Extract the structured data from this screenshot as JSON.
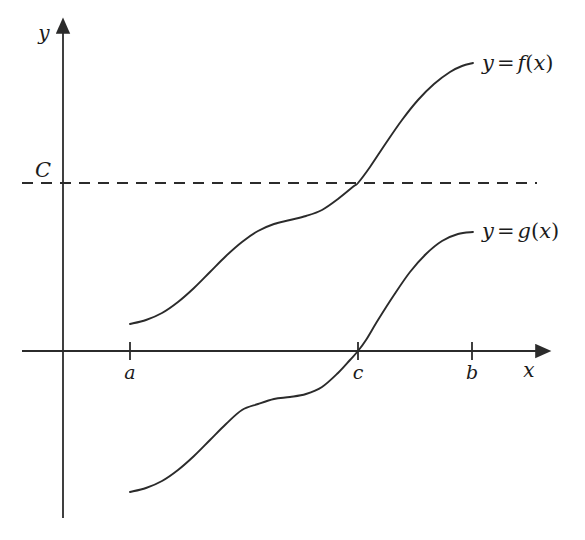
{
  "figure": {
    "kind": "math-diagram",
    "background_color": "#ffffff",
    "ink_color": "#2b2b2b",
    "axes": {
      "x_axis_label": "x",
      "y_axis_label": "y",
      "x_ticks": [
        {
          "name": "a",
          "label": "a"
        },
        {
          "name": "c",
          "label": "c"
        },
        {
          "name": "b",
          "label": "b"
        }
      ]
    },
    "constant_line": {
      "label": "C",
      "style": "dashed"
    },
    "curves": [
      {
        "id": "f",
        "label_y": "y",
        "label_eq": "=",
        "label_fn": "f",
        "label_open": "(",
        "label_arg": "x",
        "label_close": ")",
        "label_text": "y = f(x)"
      },
      {
        "id": "g",
        "label_y": "y",
        "label_eq": "=",
        "label_fn": "g",
        "label_open": "(",
        "label_arg": "x",
        "label_close": ")",
        "label_text": "y = g(x)"
      }
    ]
  },
  "chart_data": {
    "type": "line",
    "title": "",
    "xlabel": "x",
    "ylabel": "y",
    "grid": false,
    "legend": "inline-right-of-curve-ends",
    "xlim": [
      22,
      537
    ],
    "ylim": [
      518,
      32
    ],
    "annotations": [
      {
        "text": "C",
        "x": 43,
        "y": 170,
        "role": "constant-level-label"
      },
      {
        "text": "a",
        "x": 130,
        "y": 372,
        "role": "x-tick-label"
      },
      {
        "text": "c",
        "x": 358,
        "y": 372,
        "role": "x-tick-label"
      },
      {
        "text": "b",
        "x": 472,
        "y": 372,
        "role": "x-tick-label"
      },
      {
        "text": "x",
        "x": 529,
        "y": 370,
        "role": "axis-label"
      },
      {
        "text": "y",
        "x": 44,
        "y": 33,
        "role": "axis-label"
      },
      {
        "text": "y = f(x)",
        "x": 482,
        "y": 63,
        "role": "curve-label"
      },
      {
        "text": "y = g(x)",
        "x": 482,
        "y": 231,
        "role": "curve-label"
      }
    ],
    "reference_lines": [
      {
        "name": "C",
        "orientation": "horizontal",
        "y_px": 183,
        "x_start_px": 22,
        "x_end_px": 537,
        "style": "dashed"
      }
    ],
    "axis_geometry": {
      "x_axis_y_px": 351,
      "x_axis_start_px": 22,
      "x_axis_end_px": 537,
      "y_axis_x_px": 63,
      "y_axis_top_px": 32,
      "y_axis_bottom_px": 518,
      "tick_half_length_px": 9,
      "tick_positions_px": {
        "a": 130,
        "c": 358,
        "b": 472
      }
    },
    "series": [
      {
        "name": "y = f(x)",
        "comment": "sigmoid-with-plateau rising from just above the x-axis at x=a to a flat top well above C; crosses the level C exactly at x=c",
        "points_px": [
          [
            130,
            324
          ],
          [
            146,
            320
          ],
          [
            162,
            313
          ],
          [
            178,
            302
          ],
          [
            194,
            288
          ],
          [
            210,
            272
          ],
          [
            226,
            256
          ],
          [
            242,
            242
          ],
          [
            258,
            231
          ],
          [
            274,
            224
          ],
          [
            290,
            220
          ],
          [
            306,
            216
          ],
          [
            322,
            210
          ],
          [
            338,
            199
          ],
          [
            354,
            186
          ],
          [
            358,
            183
          ],
          [
            370,
            167
          ],
          [
            386,
            143
          ],
          [
            402,
            120
          ],
          [
            418,
            100
          ],
          [
            434,
            84
          ],
          [
            450,
            72
          ],
          [
            462,
            66
          ],
          [
            473,
            63
          ]
        ]
      },
      {
        "name": "y = g(x)",
        "comment": "same shape as f shifted down; rises from below the x-axis, crosses the x-axis exactly at x=c, flattens near x=b",
        "points_px": [
          [
            130,
            492
          ],
          [
            146,
            488
          ],
          [
            162,
            481
          ],
          [
            178,
            470
          ],
          [
            194,
            456
          ],
          [
            210,
            440
          ],
          [
            226,
            424
          ],
          [
            242,
            410
          ],
          [
            258,
            404
          ],
          [
            274,
            399
          ],
          [
            290,
            397
          ],
          [
            306,
            394
          ],
          [
            322,
            387
          ],
          [
            338,
            373
          ],
          [
            350,
            360
          ],
          [
            358,
            351
          ],
          [
            366,
            340
          ],
          [
            378,
            320
          ],
          [
            394,
            295
          ],
          [
            410,
            272
          ],
          [
            426,
            254
          ],
          [
            442,
            241
          ],
          [
            458,
            234
          ],
          [
            473,
            232
          ]
        ]
      }
    ]
  }
}
